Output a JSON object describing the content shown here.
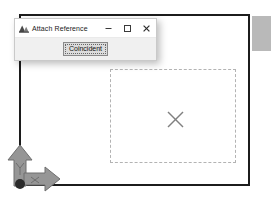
{
  "canvas": {
    "name": "sketch-canvas",
    "background_color": "#ffffff",
    "sketch_rect": {
      "label": "sketch-rectangle",
      "stroke_color": "#1c1c1c"
    },
    "vertex_highlight": {
      "label": "selected-vertex-highlight",
      "color": "#a9a9a9"
    },
    "reference_rect": {
      "label": "reference-component-outline",
      "stroke_color": "#b3b3b3",
      "style": "dash-dot"
    },
    "center_marker": {
      "label": "component-origin-cross",
      "icon": "x-cross-icon",
      "color": "#808080"
    },
    "origin_triad": {
      "label": "origin-triad",
      "x_axis_label": "X",
      "y_axis_label": "Y",
      "color": "#8c8c8c"
    }
  },
  "dialog": {
    "app_icon": "attach-reference-app-icon",
    "title": "Attach Reference",
    "window_controls": {
      "minimize": {
        "icon": "minimize-icon",
        "glyph": "—"
      },
      "maximize": {
        "icon": "maximize-icon",
        "glyph": "□"
      },
      "close": {
        "icon": "close-icon",
        "glyph": "✕"
      }
    },
    "buttons": [
      {
        "name": "coincident-button",
        "label": "Coincident",
        "state": "focused"
      }
    ]
  }
}
